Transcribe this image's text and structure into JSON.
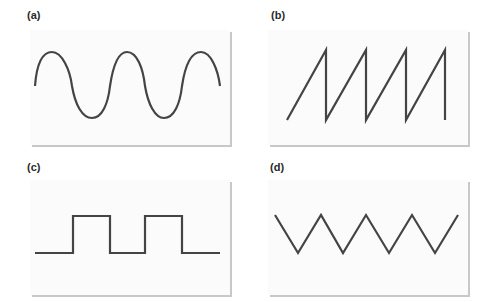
{
  "figure": {
    "panels": [
      {
        "id": "a",
        "label": "(a)",
        "waveform": "sine"
      },
      {
        "id": "b",
        "label": "(b)",
        "waveform": "sawtooth"
      },
      {
        "id": "c",
        "label": "(c)",
        "waveform": "square"
      },
      {
        "id": "d",
        "label": "(d)",
        "waveform": "triangle"
      }
    ],
    "stroke_color": "#444444",
    "panel_background": "#fbfbfb",
    "shadow_color": "#c8c8c8"
  }
}
